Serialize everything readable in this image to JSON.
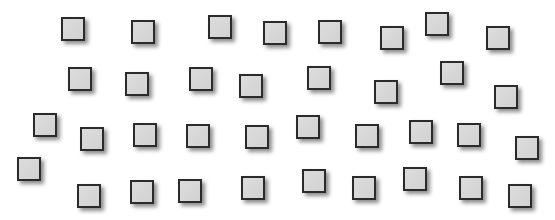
{
  "canvas": {
    "width": 555,
    "height": 220,
    "background": "#ffffff"
  },
  "style": {
    "fill": "#d6d6d6",
    "border": "#2b2b2b",
    "size": 24
  },
  "squares": [
    {
      "x": 61,
      "y": 17
    },
    {
      "x": 131,
      "y": 20
    },
    {
      "x": 208,
      "y": 15
    },
    {
      "x": 263,
      "y": 21
    },
    {
      "x": 318,
      "y": 20
    },
    {
      "x": 380,
      "y": 26
    },
    {
      "x": 425,
      "y": 12
    },
    {
      "x": 486,
      "y": 26
    },
    {
      "x": 68,
      "y": 67
    },
    {
      "x": 125,
      "y": 72
    },
    {
      "x": 189,
      "y": 67
    },
    {
      "x": 239,
      "y": 74
    },
    {
      "x": 307,
      "y": 66
    },
    {
      "x": 374,
      "y": 80
    },
    {
      "x": 440,
      "y": 61
    },
    {
      "x": 494,
      "y": 85
    },
    {
      "x": 33,
      "y": 113
    },
    {
      "x": 80,
      "y": 127
    },
    {
      "x": 133,
      "y": 123
    },
    {
      "x": 186,
      "y": 124
    },
    {
      "x": 245,
      "y": 125
    },
    {
      "x": 296,
      "y": 115
    },
    {
      "x": 355,
      "y": 124
    },
    {
      "x": 409,
      "y": 120
    },
    {
      "x": 457,
      "y": 123
    },
    {
      "x": 515,
      "y": 136
    },
    {
      "x": 17,
      "y": 157
    },
    {
      "x": 77,
      "y": 184
    },
    {
      "x": 130,
      "y": 180
    },
    {
      "x": 178,
      "y": 179
    },
    {
      "x": 241,
      "y": 176
    },
    {
      "x": 302,
      "y": 169
    },
    {
      "x": 352,
      "y": 176
    },
    {
      "x": 403,
      "y": 167
    },
    {
      "x": 459,
      "y": 176
    },
    {
      "x": 508,
      "y": 184
    }
  ]
}
